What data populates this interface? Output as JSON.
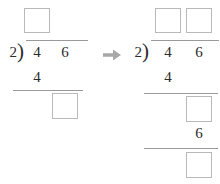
{
  "problem": {
    "type": "long-division-worksheet",
    "dividend": "46",
    "divisor": "2",
    "dividend_digits": [
      "4",
      "6"
    ]
  },
  "arrow": {
    "glyph": "→",
    "color": "#a8a8a8",
    "direction": "right"
  },
  "colors": {
    "ink": "#2b2b2b",
    "rule": "#9a9a9a",
    "box_border": "#b9b9b9",
    "arrow": "#a8a8a8",
    "background": "#ffffff"
  },
  "left_step": {
    "label": "step-1",
    "quotient_boxes": [
      {
        "name": "quotient-tens-box",
        "value": ""
      }
    ],
    "divisor": "2",
    "bracket": ")",
    "dividend_digits": [
      "4",
      "6"
    ],
    "subtrahend": "4",
    "remainder_boxes": [
      {
        "name": "remainder-box",
        "value": ""
      }
    ]
  },
  "right_step": {
    "label": "step-2",
    "quotient_boxes": [
      {
        "name": "quotient-tens-box",
        "value": ""
      },
      {
        "name": "quotient-ones-box",
        "value": ""
      }
    ],
    "divisor": "2",
    "bracket": ")",
    "dividend_digits": [
      "4",
      "6"
    ],
    "subtrahend": "4",
    "remainder_boxes": [
      {
        "name": "partial-remainder-box",
        "value": ""
      }
    ],
    "brought_down_digit": "6",
    "final_boxes": [
      {
        "name": "final-remainder-box",
        "value": ""
      }
    ]
  }
}
